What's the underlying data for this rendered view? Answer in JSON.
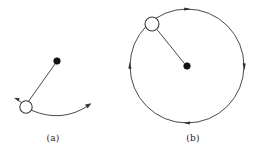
{
  "figure": {
    "background_color": "#ffffff",
    "stroke_color": "#3a3a3a",
    "fill_color": "#111111",
    "width": 254,
    "height": 160
  },
  "panels": [
    {
      "id": "a",
      "caption": "(a)",
      "description": "Ball on a string swinging along a curved arc",
      "pivot_dot": {
        "cx": 57,
        "cy": 61,
        "r": 3.2,
        "name": "pivot-point"
      },
      "ball": {
        "cx": 26,
        "cy": 107,
        "r": 6.2,
        "name": "ball-open-circle"
      },
      "string": {
        "x1": 55,
        "y1": 64,
        "x2": 28,
        "y2": 102
      },
      "arc_path": "M 21 101 L 15 97",
      "swing_arc": "M 33 110 Q 62 122 90 105",
      "swing_arrow": {
        "x": 90,
        "y": 105,
        "angle": -32
      },
      "ball_arrow": {
        "x": 15,
        "y": 97,
        "angle": -148
      }
    },
    {
      "id": "b",
      "caption": "(b)",
      "description": "Ball moving in a complete circle with direction arrows",
      "circle": {
        "cx": 187,
        "cy": 66,
        "r": 57,
        "name": "motion-circle"
      },
      "center_dot": {
        "cx": 187,
        "cy": 66,
        "r": 3.2,
        "name": "center-point"
      },
      "ball": {
        "cx": 152,
        "cy": 24,
        "r": 7.0,
        "name": "ball-open-circle"
      },
      "radius_line": {
        "x1": 157,
        "y1": 29,
        "x2": 184,
        "y2": 63
      },
      "direction_arrows": [
        {
          "angle_deg": 270,
          "label": "top-arrow"
        },
        {
          "angle_deg": 0,
          "label": "right-arrow"
        },
        {
          "angle_deg": 90,
          "label": "bottom-arrow"
        },
        {
          "angle_deg": 180,
          "label": "left-arrow"
        }
      ]
    }
  ]
}
